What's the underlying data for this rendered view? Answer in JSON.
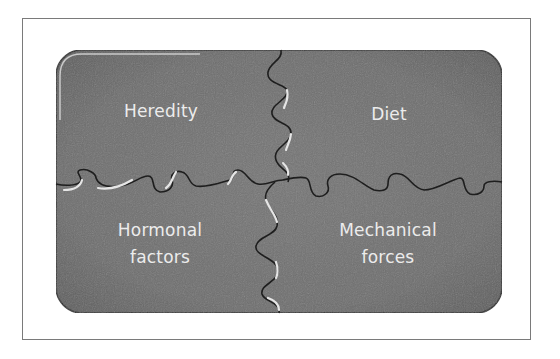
{
  "diagram": {
    "type": "jigsaw-puzzle",
    "colors": {
      "piece_fill": "#6f6f6f",
      "piece_edge": "#3a3a3a",
      "seam_dark": "#1e1e1e",
      "seam_highlight": "#e6e6e6",
      "label_text": "#ececec",
      "frame_border": "#7a7a7a",
      "background": "#ffffff"
    },
    "pieces": [
      {
        "position": "top-left",
        "label_lines": [
          "Heredity"
        ]
      },
      {
        "position": "top-right",
        "label_lines": [
          "Diet"
        ]
      },
      {
        "position": "bottom-left",
        "label_lines": [
          "Hormonal",
          "factors"
        ]
      },
      {
        "position": "bottom-right",
        "label_lines": [
          "Mechanical",
          "forces"
        ]
      }
    ]
  }
}
